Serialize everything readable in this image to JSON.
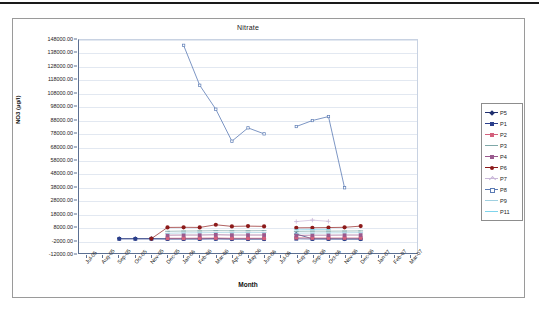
{
  "chart_data": {
    "type": "line",
    "title": "Nitrate",
    "xlabel": "Month",
    "ylabel": "NO3 (µg/l)",
    "ylim": [
      -12000,
      148000
    ],
    "ytick_step": 10000,
    "grid": true,
    "legend_position": "right",
    "yticks": [
      "148000.00",
      "138000.00",
      "128000.00",
      "118000.00",
      "108000.00",
      "98000.00",
      "88000.00",
      "78000.00",
      "68000.00",
      "58000.00",
      "48000.00",
      "38000.00",
      "28000.00",
      "18000.00",
      "8000.00",
      "-2000.00",
      "-12000.00"
    ],
    "categories": [
      "Jul-05",
      "Aug-05",
      "Sep-05",
      "Oct-05",
      "Nov-05",
      "Dec-05",
      "Jan-06",
      "Feb-06",
      "Mar-06",
      "Apr-06",
      "May-06",
      "Jun-06",
      "Jul-06",
      "Aug-06",
      "Sep-06",
      "Oct-06",
      "Nov-06",
      "Dec-06",
      "Jan-07",
      "Feb-07",
      "Mar-07"
    ],
    "series": [
      {
        "name": "P5",
        "color": "#1f2f6e",
        "marker": "diamond",
        "values": [
          null,
          null,
          -1200,
          -1200,
          -1200,
          -1300,
          -1300,
          -1300,
          -1200,
          -1400,
          -1400,
          -1400,
          null,
          2200,
          -1300,
          -1300,
          -1400,
          -1400,
          null,
          null,
          null
        ]
      },
      {
        "name": "P1",
        "color": "#2b3f8c",
        "marker": "square",
        "values": [
          null,
          null,
          -1400,
          -1400,
          -1400,
          -1500,
          -1500,
          -1500,
          -1400,
          -1500,
          -1500,
          -1500,
          null,
          -1300,
          -1500,
          -1500,
          -1500,
          -1500,
          null,
          null,
          null
        ]
      },
      {
        "name": "P2",
        "color": "#d4607c",
        "marker": "square",
        "values": [
          null,
          null,
          null,
          null,
          null,
          -900,
          -900,
          -800,
          -700,
          -900,
          -900,
          -900,
          null,
          -500,
          -700,
          -700,
          -700,
          -700,
          null,
          null,
          null
        ]
      },
      {
        "name": "P3",
        "color": "#7fa8a8",
        "marker": "line",
        "values": [
          null,
          null,
          null,
          null,
          null,
          4300,
          4500,
          4600,
          4800,
          4700,
          4700,
          4800,
          null,
          4200,
          4400,
          4400,
          4500,
          4600,
          null,
          null,
          null
        ]
      },
      {
        "name": "P4",
        "color": "#9a5a8e",
        "marker": "square",
        "values": [
          null,
          null,
          null,
          null,
          null,
          1400,
          1500,
          1500,
          1700,
          1500,
          1500,
          1500,
          null,
          1200,
          1400,
          1400,
          1500,
          1500,
          null,
          null,
          null
        ]
      },
      {
        "name": "P6",
        "color": "#8c1a1a",
        "marker": "circle",
        "values": [
          null,
          null,
          null,
          null,
          -1200,
          7200,
          7300,
          7200,
          9200,
          8000,
          8200,
          8000,
          null,
          6900,
          7000,
          7100,
          7300,
          8200,
          null,
          null,
          null
        ]
      },
      {
        "name": "P7",
        "color": "#c9b7d8",
        "marker": "plus",
        "values": [
          null,
          null,
          null,
          null,
          null,
          null,
          null,
          null,
          null,
          null,
          null,
          null,
          null,
          11600,
          12700,
          11800,
          null,
          null,
          null,
          null,
          null
        ]
      },
      {
        "name": "P8",
        "color": "#5b7bb4",
        "marker": "square-small",
        "values": [
          null,
          null,
          null,
          null,
          null,
          null,
          144000,
          114000,
          96000,
          72000,
          82000,
          77500,
          null,
          83000,
          87500,
          90500,
          37000,
          null,
          null,
          null,
          null
        ]
      },
      {
        "name": "P9",
        "color": "#9fd0e0",
        "marker": "line",
        "values": [
          null,
          null,
          null,
          null,
          null,
          2800,
          3100,
          3200,
          3400,
          3300,
          3300,
          3400,
          null,
          2900,
          3000,
          3100,
          3200,
          3300,
          null,
          null,
          null
        ]
      },
      {
        "name": "P11",
        "color": "#7fd4ec",
        "marker": "line",
        "values": [
          null,
          null,
          null,
          null,
          null,
          null,
          null,
          null,
          null,
          null,
          null,
          null,
          null,
          5400,
          5600,
          5600,
          null,
          null,
          null,
          null,
          null
        ]
      }
    ]
  }
}
